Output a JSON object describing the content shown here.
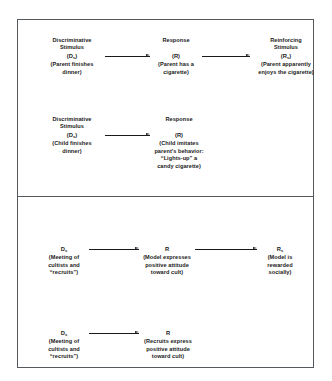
{
  "figure": {
    "panels": [
      {
        "name": "smoking-panel",
        "rows": [
          {
            "name": "parent-contingency-row",
            "cells": [
              {
                "heading": "Discriminative\nStimulus",
                "symbol": "(D",
                "subscript": "s",
                "symbol_end": ")",
                "caption": "(Parent finishes\ndinner)"
              },
              {
                "heading": "Response",
                "symbol": "(R",
                "subscript": "",
                "symbol_end": ")",
                "caption": "(Parent has a\ncigarette)"
              },
              {
                "heading": "Reinforcing\nStimulus",
                "symbol": "(R",
                "subscript": "s",
                "symbol_end": ")",
                "caption": "(Parent apparently\nenjoys the cigarette)"
              }
            ]
          },
          {
            "name": "child-contingency-row",
            "cells": [
              {
                "heading": "Discriminative\nStimulus",
                "symbol": "(D",
                "subscript": "s",
                "symbol_end": ")",
                "caption": "(Child finishes\ndinner)"
              },
              {
                "heading": "Response",
                "symbol": "(R",
                "subscript": "",
                "symbol_end": ")",
                "caption": "(Child imitates\nparent's behavior:\n“Lights-up” a\ncandy cigarette)"
              }
            ]
          }
        ]
      },
      {
        "name": "cult-panel",
        "rows": [
          {
            "name": "model-contingency-row",
            "cells": [
              {
                "heading": "",
                "symbol": "D",
                "subscript": "s",
                "symbol_end": "",
                "caption": "(Meeting of\ncultists and\n“recruits”)"
              },
              {
                "heading": "",
                "symbol": "R",
                "subscript": "",
                "symbol_end": "",
                "caption": "(Model expresses\npositive attitude\ntoward cult)"
              },
              {
                "heading": "",
                "symbol": "R",
                "subscript": "s",
                "symbol_end": "",
                "caption": "(Model is\nrewarded\nsocially)"
              }
            ]
          },
          {
            "name": "recruit-contingency-row",
            "cells": [
              {
                "heading": "",
                "symbol": "D",
                "subscript": "s",
                "symbol_end": "",
                "caption": "(Meeting of\ncultists and\n“recruits”)"
              },
              {
                "heading": "",
                "symbol": "R",
                "subscript": "",
                "symbol_end": "",
                "caption": "(Recruits express\npositive attitude\ntoward cult)"
              }
            ]
          }
        ]
      }
    ]
  }
}
